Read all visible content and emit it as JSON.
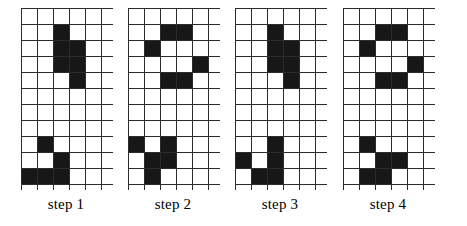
{
  "figure": {
    "grid": {
      "columns": 6,
      "rows": 12,
      "line_color": "#2b2b2b",
      "empty_color": "#ffffff",
      "filled_color": "#171717"
    }
  },
  "steps": [
    {
      "label": "step 1",
      "left": 18,
      "filled_cells": [
        [
          2,
          1
        ],
        [
          2,
          2
        ],
        [
          3,
          2
        ],
        [
          2,
          3
        ],
        [
          3,
          3
        ],
        [
          3,
          4
        ],
        [
          1,
          8
        ],
        [
          2,
          9
        ],
        [
          0,
          10
        ],
        [
          1,
          10
        ],
        [
          2,
          10
        ]
      ]
    },
    {
      "label": "step 2",
      "left": 125,
      "filled_cells": [
        [
          2,
          1
        ],
        [
          3,
          1
        ],
        [
          1,
          2
        ],
        [
          4,
          3
        ],
        [
          2,
          4
        ],
        [
          3,
          4
        ],
        [
          0,
          8
        ],
        [
          2,
          8
        ],
        [
          1,
          9
        ],
        [
          2,
          9
        ],
        [
          1,
          10
        ]
      ]
    },
    {
      "label": "step 3",
      "left": 232,
      "filled_cells": [
        [
          2,
          1
        ],
        [
          2,
          2
        ],
        [
          3,
          2
        ],
        [
          2,
          3
        ],
        [
          3,
          3
        ],
        [
          3,
          4
        ],
        [
          2,
          8
        ],
        [
          0,
          9
        ],
        [
          2,
          9
        ],
        [
          1,
          10
        ],
        [
          2,
          10
        ]
      ]
    },
    {
      "label": "step 4",
      "left": 340,
      "filled_cells": [
        [
          2,
          1
        ],
        [
          3,
          1
        ],
        [
          1,
          2
        ],
        [
          4,
          3
        ],
        [
          2,
          4
        ],
        [
          3,
          4
        ],
        [
          1,
          8
        ],
        [
          2,
          9
        ],
        [
          3,
          9
        ],
        [
          1,
          10
        ],
        [
          2,
          10
        ]
      ]
    }
  ]
}
